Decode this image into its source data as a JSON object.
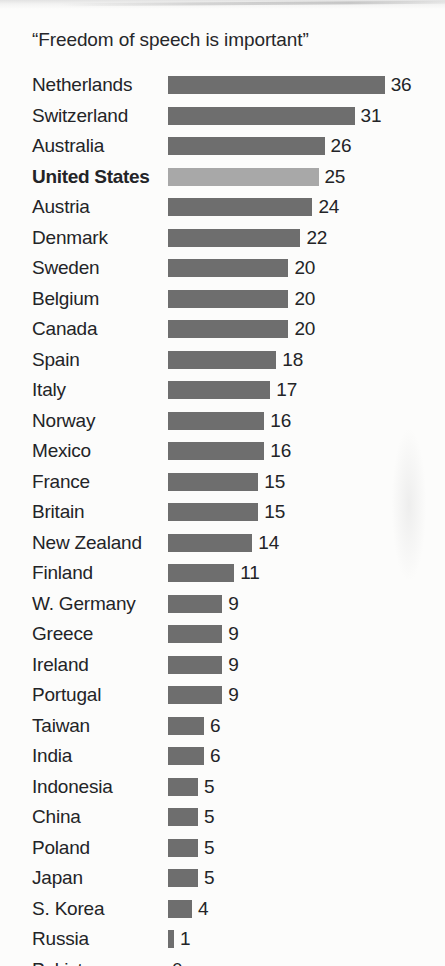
{
  "chart_data": {
    "type": "bar",
    "orientation": "horizontal",
    "title": "“Freedom of speech is important”",
    "xlabel": "",
    "ylabel": "",
    "xlim": [
      0,
      36
    ],
    "grid": false,
    "legend": null,
    "value_labels_shown": true,
    "categories": [
      "Netherlands",
      "Switzerland",
      "Australia",
      "United States",
      "Austria",
      "Denmark",
      "Sweden",
      "Belgium",
      "Canada",
      "Spain",
      "Italy",
      "Norway",
      "Mexico",
      "France",
      "Britain",
      "New Zealand",
      "Finland",
      "W. Germany",
      "Greece",
      "Ireland",
      "Portugal",
      "Taiwan",
      "India",
      "Indonesia",
      "China",
      "Poland",
      "Japan",
      "S. Korea",
      "Russia",
      "Pakistan"
    ],
    "values": [
      36,
      31,
      26,
      25,
      24,
      22,
      20,
      20,
      20,
      18,
      17,
      16,
      16,
      15,
      15,
      14,
      11,
      9,
      9,
      9,
      9,
      6,
      6,
      5,
      5,
      5,
      5,
      4,
      1,
      0
    ],
    "highlight_category": "United States",
    "bars": [
      {
        "label": "Netherlands",
        "value": 36,
        "value_text": "36",
        "highlight": false
      },
      {
        "label": "Switzerland",
        "value": 31,
        "value_text": "31",
        "highlight": false
      },
      {
        "label": "Australia",
        "value": 26,
        "value_text": "26",
        "highlight": false
      },
      {
        "label": "United States",
        "value": 25,
        "value_text": "25",
        "highlight": true
      },
      {
        "label": "Austria",
        "value": 24,
        "value_text": "24",
        "highlight": false
      },
      {
        "label": "Denmark",
        "value": 22,
        "value_text": "22",
        "highlight": false
      },
      {
        "label": "Sweden",
        "value": 20,
        "value_text": "20",
        "highlight": false
      },
      {
        "label": "Belgium",
        "value": 20,
        "value_text": "20",
        "highlight": false
      },
      {
        "label": "Canada",
        "value": 20,
        "value_text": "20",
        "highlight": false
      },
      {
        "label": "Spain",
        "value": 18,
        "value_text": "18",
        "highlight": false
      },
      {
        "label": "Italy",
        "value": 17,
        "value_text": "17",
        "highlight": false
      },
      {
        "label": "Norway",
        "value": 16,
        "value_text": "16",
        "highlight": false
      },
      {
        "label": "Mexico",
        "value": 16,
        "value_text": "16",
        "highlight": false
      },
      {
        "label": "France",
        "value": 15,
        "value_text": "15",
        "highlight": false
      },
      {
        "label": "Britain",
        "value": 15,
        "value_text": "15",
        "highlight": false
      },
      {
        "label": "New Zealand",
        "value": 14,
        "value_text": "14",
        "highlight": false
      },
      {
        "label": "Finland",
        "value": 11,
        "value_text": "11",
        "highlight": false
      },
      {
        "label": "W. Germany",
        "value": 9,
        "value_text": "9",
        "highlight": false
      },
      {
        "label": "Greece",
        "value": 9,
        "value_text": "9",
        "highlight": false
      },
      {
        "label": "Ireland",
        "value": 9,
        "value_text": "9",
        "highlight": false
      },
      {
        "label": "Portugal",
        "value": 9,
        "value_text": "9",
        "highlight": false
      },
      {
        "label": "Taiwan",
        "value": 6,
        "value_text": "6",
        "highlight": false
      },
      {
        "label": "India",
        "value": 6,
        "value_text": "6",
        "highlight": false
      },
      {
        "label": "Indonesia",
        "value": 5,
        "value_text": "5",
        "highlight": false
      },
      {
        "label": "China",
        "value": 5,
        "value_text": "5",
        "highlight": false
      },
      {
        "label": "Poland",
        "value": 5,
        "value_text": "5",
        "highlight": false
      },
      {
        "label": "Japan",
        "value": 5,
        "value_text": "5",
        "highlight": false
      },
      {
        "label": "S. Korea",
        "value": 4,
        "value_text": "4",
        "highlight": false
      },
      {
        "label": "Russia",
        "value": 1,
        "value_text": "1",
        "highlight": false
      },
      {
        "label": "Pakistan",
        "value": 0,
        "value_text": "0",
        "highlight": false
      }
    ],
    "colors": {
      "bar": "#6e6e6e",
      "bar_highlight": "#a8a8a8",
      "text": "#232427",
      "background": "#fcfcfb"
    }
  },
  "layout": {
    "bar_origin_x": 168,
    "px_per_unit": 6.02,
    "first_row_top": 71,
    "row_pitch": 30.5,
    "value_gap": 6,
    "zero_label_offset": 4
  }
}
